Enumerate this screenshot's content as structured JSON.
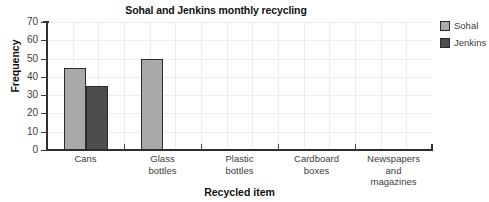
{
  "chart_data": {
    "type": "bar",
    "title": "Sohal and Jenkins monthly recycling",
    "xlabel": "Recycled item",
    "ylabel": "Frequency",
    "categories": [
      "Cans",
      "Glass\nbottles",
      "Plastic\nbottles",
      "Cardboard\nboxes",
      "Newspapers\nand\nmagazines"
    ],
    "series": [
      {
        "name": "Sohal",
        "color": "#a9a9a9",
        "values": [
          45,
          50,
          0,
          0,
          0
        ]
      },
      {
        "name": "Jenkins",
        "color": "#4d4d4d",
        "values": [
          35,
          0,
          0,
          0,
          0
        ]
      }
    ],
    "ylim": [
      0,
      70
    ],
    "ytick_labels": [
      "70",
      "60",
      "50",
      "40",
      "30",
      "20",
      "10",
      "0"
    ],
    "ytick_values": [
      70,
      60,
      50,
      40,
      30,
      20,
      10,
      0
    ],
    "grid": true,
    "legend_position": "top-right",
    "colors": {
      "axis": "#2e2e2e",
      "grid": "#ededed",
      "text": "#3c3c3c",
      "bar_outline": "#2b2b2b",
      "background": "#ffffff"
    }
  }
}
